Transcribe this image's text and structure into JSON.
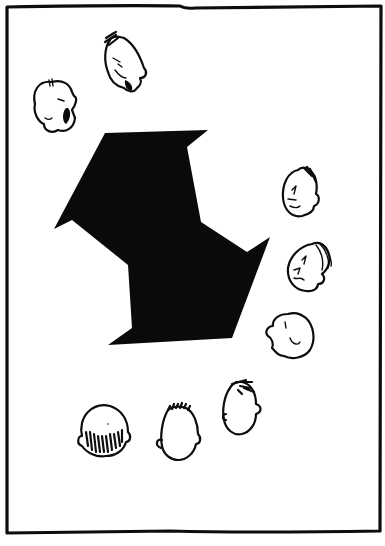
{
  "scene": {
    "type": "comic-panel",
    "description": "Wordless comic panel: ten cartoon heads arranged in a ring around a large black irregular pinwheel-like polygon",
    "colors": {
      "background": "#ffffff",
      "ink": "#0d0d0d",
      "shape_fill": "#0a0a0a"
    },
    "frame": {
      "x": 7,
      "y": 6,
      "width": 374,
      "height": 526
    },
    "central_shape": {
      "points": "105,133 208,130 187,147 201,222 247,252 270,237 232,338 108,345 132,328 128,265 72,220 54,229"
    },
    "heads": [
      {
        "id": "shouting-head",
        "cx": 56,
        "cy": 104,
        "label": "bald head shouting, mouth open"
      },
      {
        "id": "scowling-head",
        "cx": 125,
        "cy": 64,
        "label": "angry tilted head with spiky hair"
      },
      {
        "id": "smirking-head",
        "cx": 300,
        "cy": 192,
        "label": "smirking face seen from the side"
      },
      {
        "id": "grumbling-head",
        "cx": 310,
        "cy": 267,
        "label": "grumbling face with swept hair"
      },
      {
        "id": "profile-bald-head",
        "cx": 290,
        "cy": 334,
        "label": "bald head in profile, facing left"
      },
      {
        "id": "back-head-spiky",
        "cx": 241,
        "cy": 406,
        "label": "back of head with tuft of hair"
      },
      {
        "id": "back-head-crewcut",
        "cx": 178,
        "cy": 434,
        "label": "back of head with crew cut"
      },
      {
        "id": "back-head-shaded",
        "cx": 104,
        "cy": 430,
        "label": "back of head with shaded hairline"
      }
    ]
  }
}
